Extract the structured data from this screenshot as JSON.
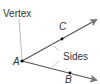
{
  "diagram": {
    "type": "angle",
    "vertex_label": "Vertex",
    "sides_label": "Sides",
    "points": {
      "vertex": "A",
      "ray1_point": "C",
      "ray2_point": "B"
    },
    "colors": {
      "ray": "#555555",
      "arrowhead": "#777777",
      "leader": "#aaaaaa",
      "text": "#333333",
      "point": "#000000"
    }
  }
}
